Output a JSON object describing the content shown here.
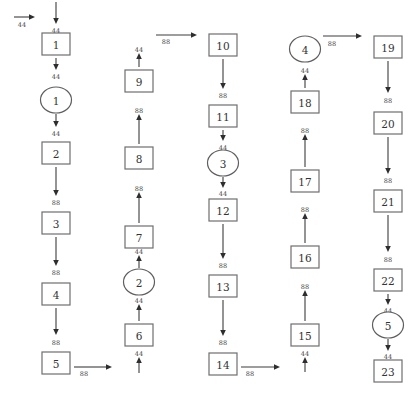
{
  "diagram": {
    "type": "flow-network",
    "colors": {
      "stroke": "#6e6e6e",
      "arrow": "#2e2e2e",
      "text": "#333333",
      "background": "#ffffff"
    },
    "nodes": [
      {
        "id": "b1",
        "shape": "box",
        "label": "1",
        "x": 56,
        "y": 44
      },
      {
        "id": "e1",
        "shape": "ellipse",
        "label": "1",
        "x": 56,
        "y": 100
      },
      {
        "id": "b2",
        "shape": "box",
        "label": "2",
        "x": 56,
        "y": 153
      },
      {
        "id": "b3",
        "shape": "box",
        "label": "3",
        "x": 56,
        "y": 223
      },
      {
        "id": "b4",
        "shape": "box",
        "label": "4",
        "x": 56,
        "y": 294
      },
      {
        "id": "b5",
        "shape": "box",
        "label": "5",
        "x": 56,
        "y": 363
      },
      {
        "id": "b6",
        "shape": "box",
        "label": "6",
        "x": 139,
        "y": 335
      },
      {
        "id": "e2",
        "shape": "ellipse",
        "label": "2",
        "x": 139,
        "y": 282
      },
      {
        "id": "b7",
        "shape": "box",
        "label": "7",
        "x": 139,
        "y": 237
      },
      {
        "id": "b8",
        "shape": "box",
        "label": "8",
        "x": 139,
        "y": 158
      },
      {
        "id": "b9",
        "shape": "box",
        "label": "9",
        "x": 139,
        "y": 81
      },
      {
        "id": "b10",
        "shape": "box",
        "label": "10",
        "x": 223,
        "y": 45
      },
      {
        "id": "b11",
        "shape": "box",
        "label": "11",
        "x": 223,
        "y": 116
      },
      {
        "id": "e3",
        "shape": "ellipse",
        "label": "3",
        "x": 223,
        "y": 163
      },
      {
        "id": "b12",
        "shape": "box",
        "label": "12",
        "x": 223,
        "y": 210
      },
      {
        "id": "b13",
        "shape": "box",
        "label": "13",
        "x": 223,
        "y": 286
      },
      {
        "id": "b14",
        "shape": "box",
        "label": "14",
        "x": 223,
        "y": 364
      },
      {
        "id": "b15",
        "shape": "box",
        "label": "15",
        "x": 305,
        "y": 335
      },
      {
        "id": "b16",
        "shape": "box",
        "label": "16",
        "x": 305,
        "y": 257
      },
      {
        "id": "b17",
        "shape": "box",
        "label": "17",
        "x": 305,
        "y": 181
      },
      {
        "id": "b18",
        "shape": "box",
        "label": "18",
        "x": 305,
        "y": 102
      },
      {
        "id": "e4",
        "shape": "ellipse",
        "label": "4",
        "x": 305,
        "y": 49
      },
      {
        "id": "b19",
        "shape": "box",
        "label": "19",
        "x": 388,
        "y": 47
      },
      {
        "id": "b20",
        "shape": "box",
        "label": "20",
        "x": 388,
        "y": 123
      },
      {
        "id": "b21",
        "shape": "box",
        "label": "21",
        "x": 388,
        "y": 201
      },
      {
        "id": "b22",
        "shape": "box",
        "label": "22",
        "x": 388,
        "y": 280
      },
      {
        "id": "e5",
        "shape": "ellipse",
        "label": "5",
        "x": 388,
        "y": 325
      },
      {
        "id": "b23",
        "shape": "box",
        "label": "23",
        "x": 388,
        "y": 371
      }
    ],
    "edges": [
      {
        "label": "44",
        "x1": 14,
        "y1": 17,
        "x2": 35,
        "y2": 17,
        "lx": 22,
        "ly": 27
      },
      {
        "label": "44",
        "x1": 56,
        "y1": 2,
        "x2": 56,
        "y2": 24,
        "lx": 56,
        "ly": 33
      },
      {
        "label": "44",
        "x1": 56,
        "y1": 58,
        "x2": 56,
        "y2": 70,
        "lx": 56,
        "ly": 79
      },
      {
        "label": "44",
        "x1": 56,
        "y1": 114,
        "x2": 56,
        "y2": 127,
        "lx": 56,
        "ly": 136
      },
      {
        "label": "88",
        "x1": 56,
        "y1": 167,
        "x2": 56,
        "y2": 196,
        "lx": 56,
        "ly": 205
      },
      {
        "label": "88",
        "x1": 56,
        "y1": 237,
        "x2": 56,
        "y2": 266,
        "lx": 56,
        "ly": 275
      },
      {
        "label": "88",
        "x1": 56,
        "y1": 308,
        "x2": 56,
        "y2": 335,
        "lx": 56,
        "ly": 345
      },
      {
        "label": "88",
        "x1": 74,
        "y1": 367,
        "x2": 112,
        "y2": 367,
        "lx": 84,
        "ly": 376
      },
      {
        "label": "44",
        "x1": 139,
        "y1": 373,
        "x2": 139,
        "y2": 357,
        "lx": 139,
        "ly": 356
      },
      {
        "label": "44",
        "x1": 139,
        "y1": 321,
        "x2": 139,
        "y2": 304,
        "lx": 139,
        "ly": 303
      },
      {
        "label": "44",
        "x1": 139,
        "y1": 268,
        "x2": 139,
        "y2": 255,
        "lx": 139,
        "ly": 254
      },
      {
        "label": "88",
        "x1": 139,
        "y1": 223,
        "x2": 139,
        "y2": 192,
        "lx": 139,
        "ly": 191
      },
      {
        "label": "88",
        "x1": 139,
        "y1": 144,
        "x2": 139,
        "y2": 114,
        "lx": 139,
        "ly": 113
      },
      {
        "label": "44",
        "x1": 139,
        "y1": 67,
        "x2": 139,
        "y2": 53,
        "lx": 139,
        "ly": 52
      },
      {
        "label": "88",
        "x1": 156,
        "y1": 35,
        "x2": 197,
        "y2": 35,
        "lx": 166,
        "ly": 44
      },
      {
        "label": "88",
        "x1": 223,
        "y1": 59,
        "x2": 223,
        "y2": 89,
        "lx": 223,
        "ly": 98
      },
      {
        "label": "44",
        "x1": 223,
        "y1": 130,
        "x2": 223,
        "y2": 141,
        "lx": 223,
        "ly": 150
      },
      {
        "label": "44",
        "x1": 223,
        "y1": 177,
        "x2": 223,
        "y2": 188,
        "lx": 223,
        "ly": 196
      },
      {
        "label": "88",
        "x1": 223,
        "y1": 224,
        "x2": 223,
        "y2": 259,
        "lx": 223,
        "ly": 268
      },
      {
        "label": "88",
        "x1": 223,
        "y1": 300,
        "x2": 223,
        "y2": 336,
        "lx": 223,
        "ly": 345
      },
      {
        "label": "88",
        "x1": 241,
        "y1": 367,
        "x2": 280,
        "y2": 367,
        "lx": 250,
        "ly": 376
      },
      {
        "label": "44",
        "x1": 305,
        "y1": 372,
        "x2": 305,
        "y2": 357,
        "lx": 305,
        "ly": 356
      },
      {
        "label": "88",
        "x1": 305,
        "y1": 321,
        "x2": 305,
        "y2": 290,
        "lx": 305,
        "ly": 289
      },
      {
        "label": "88",
        "x1": 305,
        "y1": 243,
        "x2": 305,
        "y2": 213,
        "lx": 305,
        "ly": 212
      },
      {
        "label": "88",
        "x1": 305,
        "y1": 167,
        "x2": 305,
        "y2": 134,
        "lx": 305,
        "ly": 133
      },
      {
        "label": "44",
        "x1": 305,
        "y1": 88,
        "x2": 305,
        "y2": 74,
        "lx": 305,
        "ly": 73
      },
      {
        "label": "88",
        "x1": 323,
        "y1": 36,
        "x2": 362,
        "y2": 36,
        "lx": 332,
        "ly": 46
      },
      {
        "label": "88",
        "x1": 388,
        "y1": 61,
        "x2": 388,
        "y2": 93,
        "lx": 388,
        "ly": 103
      },
      {
        "label": "88",
        "x1": 388,
        "y1": 137,
        "x2": 388,
        "y2": 174,
        "lx": 388,
        "ly": 183
      },
      {
        "label": "88",
        "x1": 388,
        "y1": 215,
        "x2": 388,
        "y2": 252,
        "lx": 388,
        "ly": 262
      },
      {
        "label": "44",
        "x1": 388,
        "y1": 294,
        "x2": 388,
        "y2": 305,
        "lx": 388,
        "ly": 313
      },
      {
        "label": "44",
        "x1": 388,
        "y1": 339,
        "x2": 388,
        "y2": 351,
        "lx": 388,
        "ly": 359
      }
    ]
  }
}
